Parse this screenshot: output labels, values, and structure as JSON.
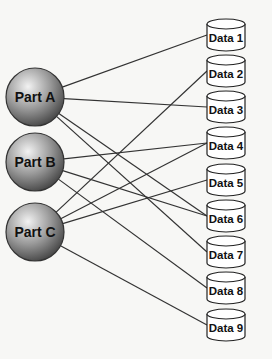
{
  "parts": [
    {
      "id": "A",
      "label": "Part A",
      "x": 35,
      "y": 97
    },
    {
      "id": "B",
      "label": "Part B",
      "x": 35,
      "y": 162
    },
    {
      "id": "C",
      "label": "Part C",
      "x": 35,
      "y": 232
    }
  ],
  "data_stores": [
    {
      "id": "1",
      "label": "Data 1",
      "y": 35
    },
    {
      "id": "2",
      "label": "Data 2",
      "y": 71
    },
    {
      "id": "3",
      "label": "Data 3",
      "y": 107
    },
    {
      "id": "4",
      "label": "Data 4",
      "y": 143
    },
    {
      "id": "5",
      "label": "Data 5",
      "y": 180
    },
    {
      "id": "6",
      "label": "Data 6",
      "y": 216
    },
    {
      "id": "7",
      "label": "Data 7",
      "y": 252
    },
    {
      "id": "8",
      "label": "Data 8",
      "y": 288
    },
    {
      "id": "9",
      "label": "Data 9",
      "y": 325
    }
  ],
  "connections": [
    [
      "A",
      "1"
    ],
    [
      "A",
      "3"
    ],
    [
      "A",
      "6"
    ],
    [
      "A",
      "7"
    ],
    [
      "B",
      "4"
    ],
    [
      "B",
      "6"
    ],
    [
      "B",
      "8"
    ],
    [
      "C",
      "2"
    ],
    [
      "C",
      "4"
    ],
    [
      "C",
      "5"
    ],
    [
      "C",
      "9"
    ]
  ],
  "colors": {
    "line": "#333333",
    "sphere_light": "#e8e8e8",
    "sphere_dark": "#555555",
    "cylinder_fill": "#ffffff",
    "stroke": "#222222"
  }
}
